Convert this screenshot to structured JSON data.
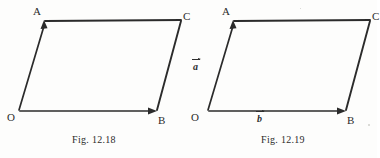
{
  "page": {
    "background_color": "#fdfdfc",
    "ink_color": "#2b2b2b"
  },
  "figures": [
    {
      "id": "fig-12-18",
      "caption": "Fig. 12.18",
      "vertices": [
        {
          "name": "O",
          "label": "O",
          "x": 18,
          "y": 112
        },
        {
          "name": "A",
          "label": "A",
          "x": 44,
          "y": 19
        },
        {
          "name": "B",
          "label": "B",
          "x": 156,
          "y": 112
        },
        {
          "name": "C",
          "label": "C",
          "x": 182,
          "y": 19
        }
      ],
      "edges": [
        {
          "name": "OA",
          "from": "O",
          "to": "A",
          "arrow": true
        },
        {
          "name": "OB",
          "from": "O",
          "to": "B",
          "arrow": true
        },
        {
          "name": "AC",
          "from": "A",
          "to": "C",
          "arrow": false
        },
        {
          "name": "BC",
          "from": "B",
          "to": "C",
          "arrow": false
        }
      ],
      "vector_labels": []
    },
    {
      "id": "fig-12-19",
      "caption": "Fig. 12.19",
      "vertices": [
        {
          "name": "O",
          "label": "O",
          "x": 18,
          "y": 112
        },
        {
          "name": "A",
          "label": "A",
          "x": 44,
          "y": 19
        },
        {
          "name": "B",
          "label": "B",
          "x": 156,
          "y": 112
        },
        {
          "name": "C",
          "label": "C",
          "x": 182,
          "y": 19
        }
      ],
      "edges": [
        {
          "name": "OA",
          "from": "O",
          "to": "A",
          "arrow": true
        },
        {
          "name": "OB",
          "from": "O",
          "to": "B",
          "arrow": true
        },
        {
          "name": "AC",
          "from": "A",
          "to": "C",
          "arrow": false
        },
        {
          "name": "BC",
          "from": "B",
          "to": "C",
          "arrow": false
        }
      ],
      "vector_labels": [
        {
          "name": "vector-a",
          "text": "a",
          "edge": "OA"
        },
        {
          "name": "vector-b",
          "text": "b",
          "edge": "OB"
        }
      ]
    }
  ]
}
